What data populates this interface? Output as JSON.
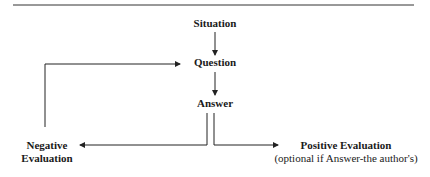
{
  "diagram": {
    "nodes": {
      "situation": "Situation",
      "question": "Question",
      "answer": "Answer",
      "negative_line1": "Negative",
      "negative_line2": "Evaluation",
      "positive": "Positive Evaluation",
      "positive_note": "(optional if Answer-the author's)"
    },
    "edges": [
      {
        "from": "Situation",
        "to": "Question"
      },
      {
        "from": "Question",
        "to": "Answer"
      },
      {
        "from": "Answer",
        "to": "Negative Evaluation"
      },
      {
        "from": "Answer",
        "to": "Positive Evaluation"
      },
      {
        "from": "Negative Evaluation",
        "to": "Question"
      }
    ],
    "line_color": "#222222"
  }
}
